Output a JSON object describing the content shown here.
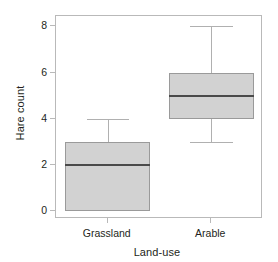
{
  "chart_data": {
    "type": "box",
    "title": "",
    "xlabel": "Land-use",
    "ylabel": "Hare count",
    "categories": [
      "Grassland",
      "Arable"
    ],
    "ylim": [
      -0.35,
      8.45
    ],
    "yticks": [
      0,
      2,
      4,
      6,
      8
    ],
    "ytick_labels": [
      "0",
      "2",
      "4",
      "6",
      "8"
    ],
    "grid": false,
    "legend": null,
    "box_fill_color": "#d2d2d2",
    "box_border_color": "#9a9a9a",
    "median_color": "#4a4a4a",
    "whisker_color": "#b0b0b0",
    "frame_color": "#b9b9b9",
    "text_color": "#231f20",
    "boxes": [
      {
        "label": "Grassland",
        "whisker_low": 0,
        "q1": 0,
        "median": 2,
        "q3": 3,
        "whisker_high": 4,
        "outliers": []
      },
      {
        "label": "Arable",
        "whisker_low": 3,
        "q1": 4,
        "median": 5,
        "q3": 6,
        "whisker_high": 8,
        "outliers": []
      }
    ]
  }
}
